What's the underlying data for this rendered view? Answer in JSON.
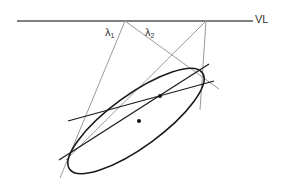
{
  "diagram": {
    "labels": {
      "vanishing_line": "VL",
      "lambda1": "λ",
      "lambda1_sub": "1",
      "lambda2": "λ",
      "lambda2_sub": "2"
    },
    "colors": {
      "grey_line": "#9a9a9a",
      "black_line": "#1a1a1a",
      "vl_line": "#555555"
    },
    "elements": [
      "vanishing line VL",
      "ellipse (conic)",
      "center point",
      "pole point on ellipse",
      "grey construction lines λ1, λ2",
      "two black secant lines"
    ]
  }
}
